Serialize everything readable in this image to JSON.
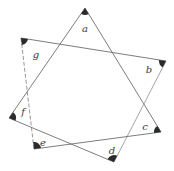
{
  "diagram": {
    "type": "seven-pointed star {7/2} with marked vertex angles",
    "vertices": [
      {
        "id": "a",
        "label": "a",
        "x": 85,
        "y": 8,
        "lx": 85,
        "ly": 29
      },
      {
        "id": "b",
        "label": "b",
        "x": 166,
        "y": 61,
        "lx": 149,
        "ly": 70
      },
      {
        "id": "c",
        "label": "c",
        "x": 161,
        "y": 132,
        "lx": 145,
        "ly": 127
      },
      {
        "id": "d",
        "label": "d",
        "x": 114,
        "y": 162,
        "lx": 112,
        "ly": 151
      },
      {
        "id": "e",
        "label": "e",
        "x": 34,
        "y": 149,
        "lx": 43,
        "ly": 143
      },
      {
        "id": "f",
        "label": "f",
        "x": 9,
        "y": 118,
        "lx": 23,
        "ly": 112
      },
      {
        "id": "g",
        "label": "g",
        "x": 21,
        "y": 38,
        "lx": 36,
        "ly": 55
      }
    ],
    "edges": [
      {
        "from": "a",
        "to": "c",
        "style": "solid"
      },
      {
        "from": "a",
        "to": "f",
        "style": "solid"
      },
      {
        "from": "g",
        "to": "b",
        "style": "solid"
      },
      {
        "from": "g",
        "to": "e",
        "style": "dashed"
      },
      {
        "from": "b",
        "to": "d",
        "style": "light"
      },
      {
        "from": "f",
        "to": "d",
        "style": "solid"
      },
      {
        "from": "e",
        "to": "c",
        "style": "solid"
      }
    ],
    "angle_markers": [
      "a",
      "b",
      "c",
      "d",
      "e",
      "f",
      "g"
    ],
    "colors": {
      "line": "#6e6e6e",
      "marker": "#2b2b2b",
      "label": "#3a3a3a",
      "background": "#ffffff"
    }
  }
}
